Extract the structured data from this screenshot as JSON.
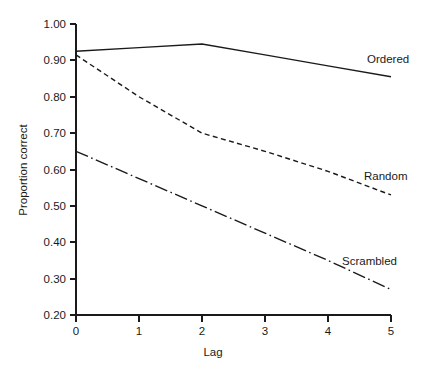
{
  "chart_data": {
    "type": "line",
    "title": "",
    "xlabel": "Lag",
    "ylabel": "Proportion correct",
    "x": [
      0,
      1,
      2,
      3,
      4,
      5
    ],
    "xlim": [
      0,
      5
    ],
    "ylim": [
      0.2,
      1.0
    ],
    "xticks": [
      "0",
      "1",
      "2",
      "3",
      "4",
      "5"
    ],
    "yticks": [
      "0.20",
      "0.30",
      "0.40",
      "0.50",
      "0.60",
      "0.70",
      "0.80",
      "0.90",
      "1.00"
    ],
    "grid": false,
    "legend_position": "inline-right-of-line-end",
    "series": [
      {
        "name": "Ordered",
        "style": "solid",
        "color": "#1a1a1a",
        "values": [
          0.925,
          0.935,
          0.945,
          0.915,
          0.885,
          0.855
        ],
        "label_text": "Ordered"
      },
      {
        "name": "Random",
        "style": "dashed",
        "color": "#1a1a1a",
        "values": [
          0.915,
          0.8,
          0.7,
          0.65,
          0.595,
          0.53
        ],
        "label_text": "Random"
      },
      {
        "name": "Scrambled",
        "style": "dash-dot",
        "color": "#1a1a1a",
        "values": [
          0.65,
          0.575,
          0.5,
          0.425,
          0.35,
          0.27
        ],
        "label_text": "Scrambled"
      }
    ]
  },
  "axes": {
    "y_tick_labels": [
      "1.00",
      "0.90",
      "0.80",
      "0.70",
      "0.60",
      "0.50",
      "0.40",
      "0.30",
      "0.20"
    ],
    "x_tick_labels": [
      "0",
      "1",
      "2",
      "3",
      "4",
      "5"
    ],
    "x_axis_title": "Lag",
    "y_axis_title": "Proportion correct"
  },
  "annotations": {
    "ordered_label": "Ordered",
    "random_label": "Random",
    "scrambled_label": "Scrambled"
  },
  "colors": {
    "ink": "#1a1a1a",
    "background": "#ffffff"
  }
}
